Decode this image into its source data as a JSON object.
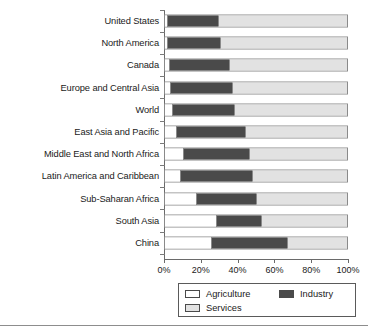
{
  "chart_data": {
    "type": "bar",
    "orientation": "horizontal",
    "stacked": true,
    "normalized_percent": true,
    "title": "",
    "subtitle": "",
    "xlabel": "",
    "ylabel": "",
    "xlim": [
      0,
      100
    ],
    "grid": false,
    "legend_position": "bottom",
    "categories": [
      "United States",
      "North America",
      "Canada",
      "Europe and Central Asia",
      "World",
      "East Asia and Pacific",
      "Middle East and North Africa",
      "Latin America and Caribbean",
      "Sub-Saharan Africa",
      "South Asia",
      "China"
    ],
    "series": [
      {
        "name": "Agriculture",
        "color": "#ffffff",
        "values": [
          1,
          1,
          2,
          3,
          4,
          6,
          10,
          8,
          17,
          28,
          25
        ]
      },
      {
        "name": "Industry",
        "color": "#4a4a4a",
        "values": [
          28,
          29,
          33,
          34,
          34,
          38,
          36,
          40,
          33,
          25,
          42
        ]
      },
      {
        "name": "Services",
        "color": "#e2e2e2",
        "values": [
          71,
          70,
          65,
          63,
          62,
          56,
          54,
          52,
          50,
          47,
          33
        ]
      }
    ],
    "xticks": [
      0,
      20,
      40,
      60,
      80,
      100
    ],
    "xticklabels": [
      "0%",
      "20%",
      "40%",
      "60%",
      "80%",
      "100%"
    ]
  },
  "legend": {
    "entries": [
      {
        "label": "Agriculture",
        "swatch": "sw-agriculture"
      },
      {
        "label": "Industry",
        "swatch": "sw-industry"
      },
      {
        "label": "Services",
        "swatch": "sw-services"
      }
    ]
  },
  "colors": {
    "agriculture": "#ffffff",
    "industry": "#4a4a4a",
    "services": "#e2e2e2",
    "axis": "#6a6a6a",
    "outline": "#8a8a8a"
  }
}
